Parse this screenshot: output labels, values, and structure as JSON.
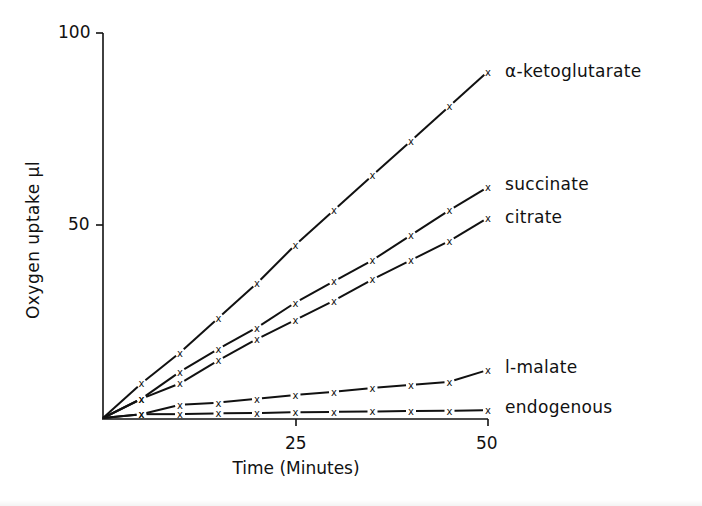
{
  "chart_data": {
    "type": "line",
    "title": "",
    "xlabel": "Time (Minutes)",
    "ylabel": "Oxygen uptake μl",
    "xlim": [
      0,
      50
    ],
    "ylim": [
      0,
      100
    ],
    "x_ticks": [
      0,
      25,
      50
    ],
    "x_tick_labels": [
      "",
      "25",
      "50"
    ],
    "y_ticks": [
      0,
      50,
      100
    ],
    "y_tick_labels": [
      "",
      "50",
      "100"
    ],
    "grid": false,
    "legend_position": "inline-right",
    "marker": "x",
    "x": [
      0,
      5,
      10,
      15,
      20,
      25,
      30,
      35,
      40,
      45,
      50
    ],
    "series": [
      {
        "name": "α-ketoglutarate",
        "values": [
          0,
          9,
          17,
          26,
          35,
          45,
          54,
          63,
          72,
          81,
          90
        ]
      },
      {
        "name": "succinate",
        "values": [
          0,
          5,
          12,
          18,
          23.5,
          30,
          35.5,
          41,
          47.5,
          54,
          60
        ]
      },
      {
        "name": "citrate",
        "values": [
          0,
          5,
          9,
          15,
          20.5,
          25.5,
          30.5,
          36,
          41,
          46,
          52
        ]
      },
      {
        "name": "l-malate",
        "values": [
          0,
          1,
          3.4,
          4,
          5,
          6,
          6.8,
          7.8,
          8.6,
          9.4,
          12.5
        ]
      },
      {
        "name": "endogenous",
        "values": [
          0,
          1,
          1,
          1.2,
          1.3,
          1.5,
          1.6,
          1.7,
          1.8,
          1.9,
          2
        ]
      }
    ]
  },
  "axes": {
    "xlabel": "Time (Minutes)",
    "ylabel": "Oxygen uptake μl",
    "x_tick_25": "25",
    "x_tick_50": "50",
    "y_tick_50": "50",
    "y_tick_100": "100"
  },
  "labels": {
    "akg": "α-ketoglutarate",
    "succinate": "succinate",
    "citrate": "citrate",
    "malate": "l-malate",
    "endogenous": "endogenous"
  },
  "colors": {
    "ink": "#111111",
    "background": "#ffffff"
  }
}
